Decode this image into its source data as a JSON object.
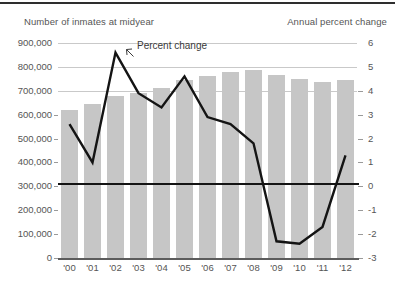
{
  "header": {
    "left_label": "Number of inmates at midyear",
    "right_label": "Annual percent change"
  },
  "annotation": {
    "label": "Percent change"
  },
  "chart_data": {
    "type": "bar",
    "title": "",
    "subtitle": "",
    "xlabel": "",
    "ylabel": "Number of inmates at midyear",
    "y2label": "Annual percent change",
    "grid": true,
    "legend": "annotation-callout",
    "categories": [
      "'00",
      "'01",
      "'02",
      "'03",
      "'04",
      "'05",
      "'06",
      "'07",
      "'08",
      "'09",
      "'10",
      "'11",
      "'12"
    ],
    "ylim": [
      0,
      900000
    ],
    "yticks": [
      0,
      100000,
      200000,
      300000,
      400000,
      500000,
      600000,
      700000,
      800000,
      900000
    ],
    "ytick_labels": [
      "0",
      "100,000",
      "200,000",
      "300,000",
      "400,000",
      "500,000",
      "600,000",
      "700,000",
      "800,000",
      "900,000"
    ],
    "y2lim": [
      -3,
      6
    ],
    "y2ticks": [
      -3,
      -2,
      -1,
      0,
      1,
      2,
      3,
      4,
      5,
      6
    ],
    "y2tick_labels": [
      "-3",
      "-2",
      "-1",
      "0",
      "1",
      "2",
      "3",
      "4",
      "5",
      "6"
    ],
    "series": [
      {
        "name": "Number of inmates at midyear",
        "type": "bar",
        "axis": "left",
        "color": "#c6c6c6",
        "values": [
          621000,
          645000,
          680000,
          692000,
          710000,
          747000,
          761000,
          777000,
          786000,
          767000,
          749000,
          736000,
          744000
        ]
      },
      {
        "name": "Percent change",
        "type": "line",
        "axis": "right",
        "color": "#141414",
        "values": [
          2.6,
          1.0,
          5.6,
          3.9,
          3.3,
          4.6,
          2.9,
          2.6,
          1.8,
          -2.3,
          -2.4,
          -1.7,
          1.3
        ]
      }
    ],
    "zero_reference_line": {
      "axis": "right",
      "value": 0,
      "color": "#141414"
    }
  }
}
